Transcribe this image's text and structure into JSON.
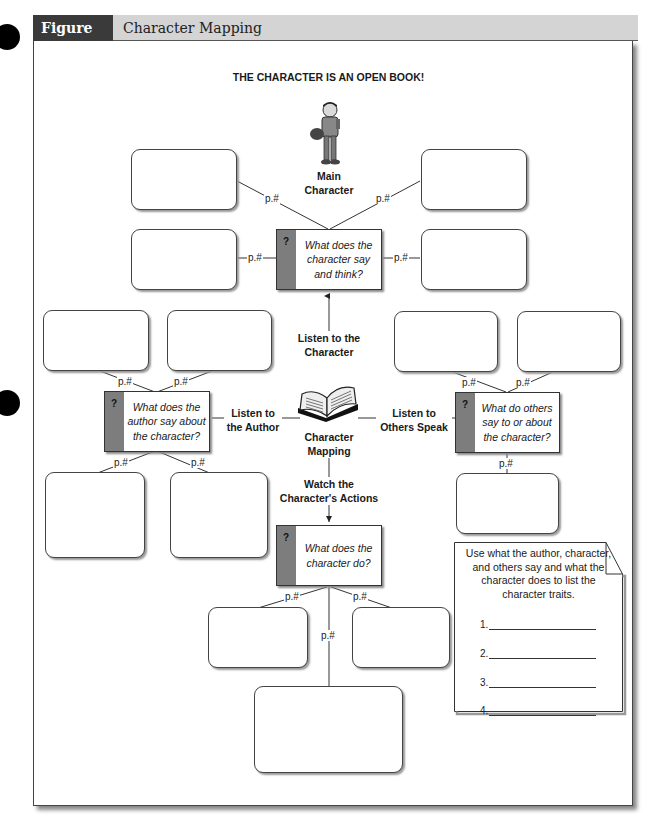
{
  "figure": {
    "number": "Figure 24.1",
    "title": "Character Mapping",
    "header_dark": "#3a3a3a",
    "header_light": "#d4d4d4"
  },
  "main_title": "THE CHARACTER IS AN OPEN BOOK!",
  "center": {
    "main_character_label": "Main\nCharacter",
    "book_label": "Character\nMapping"
  },
  "branches": {
    "top": {
      "label": "Listen to the\nCharacter",
      "question": "What does the\ncharacter say\nand think?"
    },
    "left": {
      "label": "Listen to\nthe Author",
      "question": "What does the\nauthor say about\nthe character?"
    },
    "right": {
      "label": "Listen to\nOthers Speak",
      "question": "What do others\nsay to or about\nthe character?"
    },
    "bottom": {
      "label": "Watch the\nCharacter's Actions",
      "question": "What does the\ncharacter do?"
    }
  },
  "question_mark": "?",
  "page_ref": "p.#",
  "note": {
    "text": "Use what the author, character, and others say and what the character does to list the character traits.",
    "traits": [
      "1.",
      "2.",
      "3.",
      "4."
    ]
  }
}
